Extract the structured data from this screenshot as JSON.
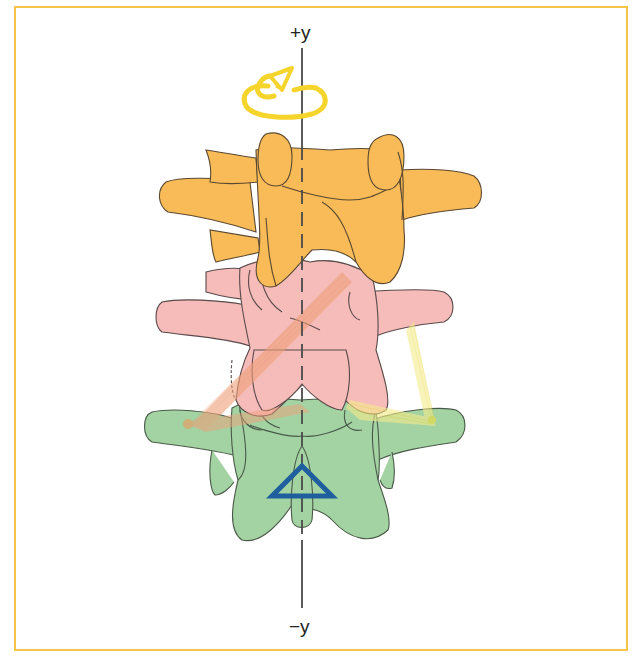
{
  "figure": {
    "type": "anatomical-diagram",
    "axis": {
      "top_label": "+y",
      "bottom_label": "−y"
    },
    "markers": {
      "rotation_arrow": "yellow curled rotation arrow about +y axis",
      "pivot": "blue triangle (instantaneous axis of rotation)"
    },
    "vertebrae": [
      {
        "name": "upper-vertebra",
        "color": "#f7b955"
      },
      {
        "name": "middle-vertebra",
        "color": "#f4b8b6"
      },
      {
        "name": "lower-vertebra",
        "color": "#9fcf9f"
      }
    ],
    "ligaments": [
      {
        "name": "left-ligament-band",
        "color": "#f0a07a"
      },
      {
        "name": "right-ligament-band",
        "color": "#f5ec8c"
      }
    ],
    "colors": {
      "frame": "#f6c64a",
      "axis": "#444444",
      "rotation_arrow": "#f5d52e",
      "pivot_triangle": "#1f5f9e",
      "outline": "#5a4a3a"
    }
  }
}
